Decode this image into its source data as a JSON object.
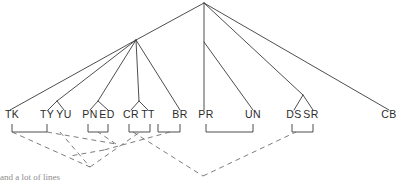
{
  "figure": {
    "background_color": "#ffffff",
    "solid_line_color": "#3a3a3a",
    "dashed_line_color": "#6d6d6d",
    "label_color": "#2b2b2b"
  },
  "leaves": [
    {
      "id": "TK",
      "label": "TK",
      "x": 12,
      "y": 118
    },
    {
      "id": "TY",
      "label": "TY",
      "x": 47,
      "y": 118
    },
    {
      "id": "YU",
      "label": "YU",
      "x": 64,
      "y": 118
    },
    {
      "id": "PN",
      "label": "PN",
      "x": 90,
      "y": 118
    },
    {
      "id": "ED",
      "label": "ED",
      "x": 107,
      "y": 118
    },
    {
      "id": "CR",
      "label": "CR",
      "x": 131,
      "y": 118
    },
    {
      "id": "TT",
      "label": "TT",
      "x": 148,
      "y": 118
    },
    {
      "id": "BR",
      "label": "BR",
      "x": 180,
      "y": 118
    },
    {
      "id": "PR",
      "label": "PR",
      "x": 206,
      "y": 118
    },
    {
      "id": "UN",
      "label": "UN",
      "x": 253,
      "y": 118
    },
    {
      "id": "DS",
      "label": "DS",
      "x": 294,
      "y": 118
    },
    {
      "id": "SR",
      "label": "SR",
      "x": 311,
      "y": 118
    },
    {
      "id": "CB",
      "label": "CB",
      "x": 389,
      "y": 118
    }
  ],
  "brackets": [
    {
      "name": "bracket-tk-ty",
      "x1": 12,
      "x2": 47,
      "y": 124,
      "depth": 8
    },
    {
      "name": "bracket-pn-ed",
      "x1": 88,
      "x2": 108,
      "y": 124,
      "depth": 8
    },
    {
      "name": "bracket-cr-tt",
      "x1": 129,
      "x2": 150,
      "y": 124,
      "depth": 8
    },
    {
      "name": "bracket-br",
      "x1": 158,
      "x2": 180,
      "y": 124,
      "depth": 8
    },
    {
      "name": "bracket-pr-un",
      "x1": 206,
      "x2": 253,
      "y": 124,
      "depth": 8
    },
    {
      "name": "bracket-ds-sr",
      "x1": 292,
      "x2": 313,
      "y": 124,
      "depth": 8
    }
  ],
  "solid_edges": [
    {
      "name": "root-to-left-cluster",
      "points": "204,3 136,40"
    },
    {
      "name": "root-to-pr",
      "points": "204,3 204,110"
    },
    {
      "name": "root-to-un",
      "points": "204,42 253,110"
    },
    {
      "name": "root-to-dssr",
      "points": "204,3 303,95"
    },
    {
      "name": "root-to-cb",
      "points": "204,3 389,110"
    },
    {
      "name": "cluster-to-tk",
      "points": "136,40 10,110"
    },
    {
      "name": "cluster-to-tyyu",
      "points": "136,40 57,101"
    },
    {
      "name": "cluster-to-pned",
      "points": "136,40 98,101"
    },
    {
      "name": "cluster-to-crtt",
      "points": "136,40 139,101"
    },
    {
      "name": "cluster-to-br",
      "points": "136,40 180,110"
    },
    {
      "name": "tyyu-split-left",
      "points": "57,101 48,110"
    },
    {
      "name": "tyyu-split-right",
      "points": "57,101 64,110"
    },
    {
      "name": "pned-split-left",
      "points": "98,101 90,110"
    },
    {
      "name": "pned-split-right",
      "points": "98,101 108,110"
    },
    {
      "name": "crtt-split-left",
      "points": "139,101 131,110"
    },
    {
      "name": "crtt-split-right",
      "points": "139,101 148,110"
    },
    {
      "name": "dssr-split-left",
      "points": "303,95 294,110"
    },
    {
      "name": "dssr-split-right",
      "points": "303,95 313,110"
    }
  ],
  "dashed_edges": [
    {
      "name": "dash-tk-to-vertexA",
      "points": "12,132 90,167"
    },
    {
      "name": "dash-tyyu-to-vertexA",
      "points": "60,132 90,167"
    },
    {
      "name": "dash-vertexA-to-crtt",
      "points": "90,167 140,132"
    },
    {
      "name": "dash-ty-to-ridge",
      "points": "47,132 116,144"
    },
    {
      "name": "dash-ridge-to-pned",
      "points": "116,144 98,132"
    },
    {
      "name": "dash-crtt-to-vertexB",
      "points": "133,132 203,176"
    },
    {
      "name": "dash-brgroup-to-fold",
      "points": "170,132 104,150"
    },
    {
      "name": "dash-fold-to-left",
      "points": "104,150 70,156"
    },
    {
      "name": "dash-vertexB-to-dssr",
      "points": "203,176 296,132"
    }
  ],
  "caption": {
    "partial_text": "and a lot of lines"
  }
}
